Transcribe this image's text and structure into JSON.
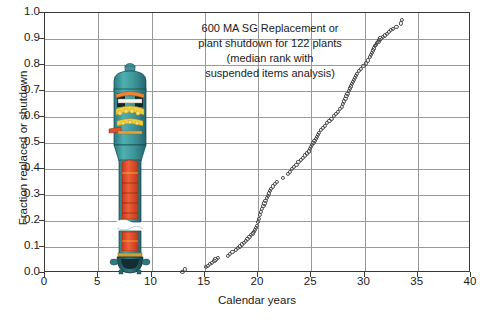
{
  "chart_data": {
    "type": "scatter",
    "title": "600 MA SG Replacement or plant shutdown for 122 plants (median rank with suspended items analysis)",
    "title_lines": [
      "600 MA SG Replacement or",
      "plant shutdown for 122 plants",
      "(median rank with",
      "suspended items analysis)"
    ],
    "xlabel": "Calendar years",
    "ylabel": "Fraction replaced or shutdown",
    "xlim": [
      0,
      40
    ],
    "ylim": [
      0,
      1.0
    ],
    "xticks": [
      0,
      5,
      10,
      15,
      20,
      25,
      30,
      35,
      40
    ],
    "yticks": [
      "0.0",
      "0.1",
      "0.2",
      "0.3",
      "0.4",
      "0.5",
      "0.6",
      "0.7",
      "0.8",
      "0.9",
      "1.0"
    ],
    "grid": true,
    "legend": "none",
    "marker": "open-circle",
    "marker_color": "#4a4a4a",
    "n_points": 122,
    "series": [
      {
        "name": "Fraction replaced or shutdown",
        "x": [
          12.9,
          13.1,
          15.1,
          15.3,
          15.5,
          15.7,
          15.9,
          16.0,
          16.2,
          17.2,
          17.4,
          17.6,
          17.9,
          18.1,
          18.3,
          18.5,
          18.7,
          18.9,
          19.0,
          19.2,
          19.3,
          19.5,
          19.6,
          19.7,
          19.8,
          19.9,
          20.0,
          20.1,
          20.2,
          20.3,
          20.4,
          20.5,
          20.6,
          20.7,
          20.8,
          20.9,
          21.0,
          21.1,
          21.2,
          21.4,
          21.6,
          21.8,
          22.3,
          22.8,
          23.0,
          23.2,
          23.4,
          23.6,
          23.8,
          24.0,
          24.2,
          24.4,
          24.6,
          24.8,
          24.9,
          25.0,
          25.1,
          25.2,
          25.3,
          25.4,
          25.5,
          25.6,
          25.7,
          25.9,
          26.1,
          26.3,
          26.5,
          26.7,
          26.9,
          27.1,
          27.3,
          27.5,
          27.7,
          27.9,
          28.0,
          28.1,
          28.2,
          28.3,
          28.4,
          28.5,
          28.6,
          28.7,
          28.8,
          28.9,
          29.0,
          29.1,
          29.2,
          29.3,
          29.5,
          29.7,
          29.9,
          30.1,
          30.3,
          30.5,
          30.6,
          30.7,
          30.8,
          30.9,
          31.0,
          31.1,
          31.2,
          31.3,
          31.4,
          31.5,
          31.7,
          31.9,
          32.1,
          32.3,
          32.5,
          32.7,
          33.0,
          33.4,
          33.5
        ],
        "y": [
          0.005,
          0.014,
          0.022,
          0.028,
          0.034,
          0.04,
          0.046,
          0.052,
          0.058,
          0.066,
          0.073,
          0.08,
          0.088,
          0.095,
          0.102,
          0.11,
          0.117,
          0.124,
          0.131,
          0.138,
          0.145,
          0.152,
          0.159,
          0.166,
          0.173,
          0.182,
          0.195,
          0.208,
          0.222,
          0.235,
          0.248,
          0.258,
          0.268,
          0.278,
          0.288,
          0.297,
          0.306,
          0.315,
          0.324,
          0.333,
          0.342,
          0.351,
          0.365,
          0.38,
          0.39,
          0.399,
          0.408,
          0.417,
          0.426,
          0.435,
          0.444,
          0.452,
          0.46,
          0.468,
          0.476,
          0.484,
          0.492,
          0.5,
          0.508,
          0.516,
          0.524,
          0.532,
          0.54,
          0.549,
          0.558,
          0.567,
          0.576,
          0.585,
          0.594,
          0.603,
          0.612,
          0.621,
          0.63,
          0.64,
          0.65,
          0.66,
          0.67,
          0.68,
          0.69,
          0.7,
          0.71,
          0.718,
          0.726,
          0.734,
          0.742,
          0.75,
          0.758,
          0.766,
          0.776,
          0.786,
          0.796,
          0.806,
          0.818,
          0.83,
          0.84,
          0.848,
          0.856,
          0.864,
          0.872,
          0.878,
          0.884,
          0.89,
          0.896,
          0.902,
          0.908,
          0.914,
          0.92,
          0.928,
          0.936,
          0.94,
          0.948,
          0.96,
          0.975
        ]
      }
    ]
  },
  "artwork": {
    "name": "steam-generator-cutaway",
    "description": "Cutaway illustration of a recirculating steam generator",
    "shell_color": "#3f9a9c",
    "internals_color": "#e2502a",
    "highlight_color": "#f0c33a"
  }
}
